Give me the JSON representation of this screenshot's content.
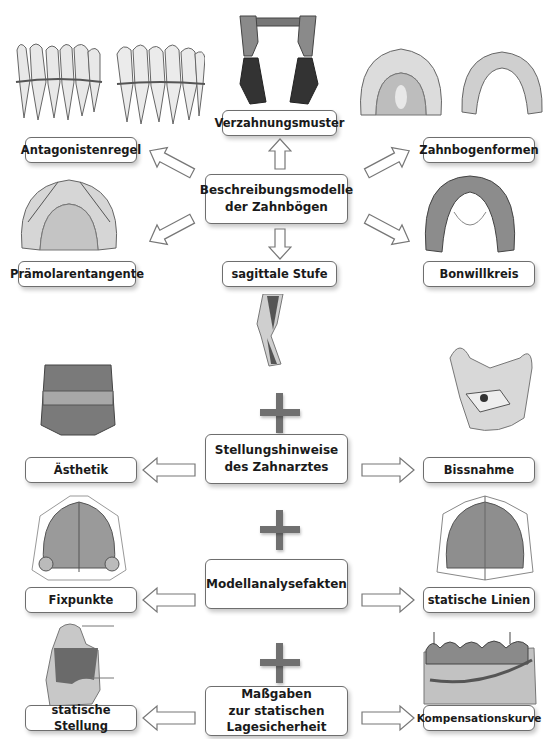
{
  "diagram": {
    "section1": {
      "center": "Beschreibungsmodelle\nder Zahnbögen",
      "top": "Verzahnungsmuster",
      "bottom": "sagittale Stufe",
      "upper_left": "Antagonistenregel",
      "lower_left": "Prämolarentangente",
      "upper_right": "Zahnbogenformen",
      "lower_right": "Bonwillkreis"
    },
    "section2": {
      "center": "Stellungshinweise\ndes Zahnarztes",
      "left": "Ästhetik",
      "right": "Bissnahme"
    },
    "section3": {
      "center": "Modellanalysefakten",
      "left": "Fixpunkte",
      "right": "statische Linien"
    },
    "section4": {
      "center": "Maßgaben\nzur statischen\nLagesicherheit",
      "left": "statische Stellung",
      "right": "Kompensationskurve"
    },
    "icons": {
      "connector": "plus-sign",
      "arrows": "hollow-block-arrow"
    }
  }
}
